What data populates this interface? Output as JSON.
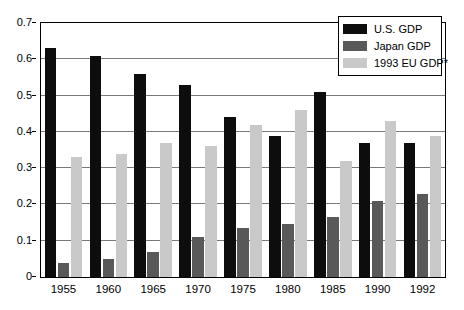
{
  "chart_data": {
    "type": "bar",
    "title": "",
    "subtitle": "",
    "xlabel": "",
    "ylabel": "",
    "categories": [
      "1955",
      "1960",
      "1965",
      "1970",
      "1975",
      "1980",
      "1985",
      "1990",
      "1992"
    ],
    "series": [
      {
        "name": "U.S. GDP",
        "color": "#0d0d0d",
        "values": [
          0.63,
          0.61,
          0.56,
          0.53,
          0.44,
          0.39,
          0.51,
          0.37,
          0.37
        ]
      },
      {
        "name": "Japan GDP",
        "color": "#595959",
        "values": [
          0.04,
          0.05,
          0.07,
          0.11,
          0.135,
          0.145,
          0.165,
          0.21,
          0.23
        ]
      },
      {
        "name": "1993 EU GDP*",
        "color": "#c9c9c9",
        "values": [
          0.33,
          0.34,
          0.37,
          0.36,
          0.42,
          0.46,
          0.32,
          0.43,
          0.39
        ]
      }
    ],
    "ylim": [
      0,
      0.7
    ],
    "yticks": [
      "0",
      "0.1",
      "0.2",
      "0.3",
      "0.4",
      "0.5",
      "0.6",
      "0.7"
    ],
    "ytick_values": [
      0,
      0.1,
      0.2,
      0.3,
      0.4,
      0.5,
      0.6,
      0.7
    ],
    "grid": true,
    "legend_position": "top-right",
    "legend": [
      {
        "label": "U.S. GDP",
        "color": "#0d0d0d"
      },
      {
        "label": "Japan GDP",
        "color": "#595959"
      },
      {
        "label": "1993 EU GDP*",
        "color": "#c9c9c9"
      }
    ]
  }
}
